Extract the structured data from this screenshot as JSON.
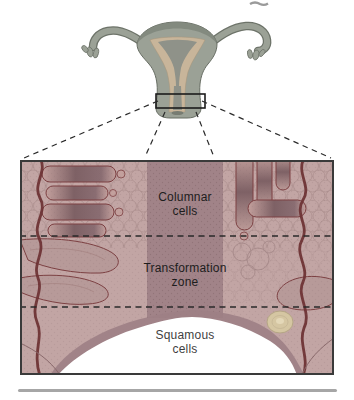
{
  "figure": {
    "alt": "Diagram of the uterus and cervix with a magnified histology panel of the cervical transformation zone",
    "labels": {
      "columnar": "Columnar cells",
      "transformation": "Transformation zone",
      "squamous": "Squamous cells"
    },
    "colors": {
      "panel_base": "#c2a5a4",
      "canal_band": "#a18388",
      "collar": "#9d7f85",
      "dome": "#ffffff",
      "gland_outline": "#7c4042",
      "vessel_line": "#6e3335",
      "scale_outline": "#ab8e8d",
      "uterus_body": "#9ba196",
      "uterus_outline": "#676d63",
      "endometrium": "#c8b59a",
      "cavity": "#8f9289",
      "cyst": "#d5c6a2",
      "dashed_line": "#2a2a2a",
      "panel_border": "#3a3a3a",
      "divider": "#a6a6a6"
    }
  }
}
